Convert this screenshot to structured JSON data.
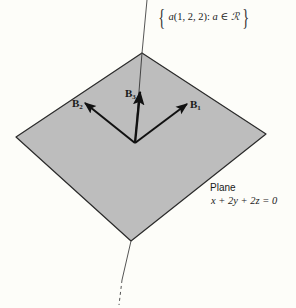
{
  "figure": {
    "type": "3d-vector-diagram",
    "line_label": {
      "open_brace": "{",
      "close_brace": "}",
      "scalar": "a",
      "vector": "(1, 2, 2)",
      "separator": ":",
      "condition": "a ∈ ℛ"
    },
    "plane_label": {
      "title": "Plane",
      "equation": "x + 2y + 2z = 0"
    },
    "vectors": [
      {
        "name": "B",
        "subscript": "1"
      },
      {
        "name": "B",
        "subscript": "2"
      },
      {
        "name": "B",
        "subscript": "3"
      }
    ],
    "colors": {
      "plane_fill": "#bdbdbd",
      "plane_edge": "#2a2a2a",
      "vector": "#111111",
      "line": "#555555",
      "background": "#fdfdf9"
    }
  }
}
